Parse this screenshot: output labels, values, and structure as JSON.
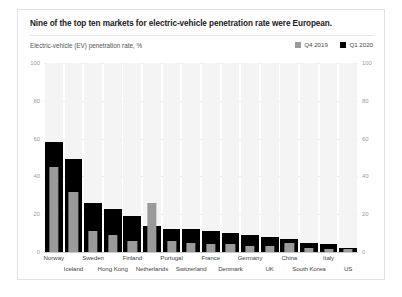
{
  "header": {
    "title": "Nine of the top ten markets for electric-vehicle penetration rate were European.",
    "subtitle": "Electric-vehicle (EV) penetration rate, %"
  },
  "legend": {
    "items": [
      {
        "label": "Q4 2019",
        "color": "#9a9a9a",
        "swatch_name": "legend-swatch-q4-2019"
      },
      {
        "label": "Q1 2020",
        "color": "#000000",
        "swatch_name": "legend-swatch-q1-2020"
      }
    ]
  },
  "colors": {
    "q4_2019": "#9a9a9a",
    "q1_2020": "#000000",
    "bar_track": "#f4f4f4",
    "gridline": "#ececec",
    "axis": "#c9c9c9",
    "card_border": "#e2e2e2",
    "title_text": "#1a1a1a",
    "subtitle_text": "#555555",
    "tick_text": "#9b9b9b",
    "xlabel_text": "#444444"
  },
  "chart_data": {
    "type": "bar",
    "title": "Nine of the top ten markets for electric-vehicle penetration rate were European.",
    "subtitle": "Electric-vehicle (EV) penetration rate, %",
    "xlabel": "",
    "ylabel": "Electric-vehicle (EV) penetration rate, %",
    "ylim": [
      0,
      100
    ],
    "yticks": [
      0,
      20,
      40,
      60,
      80,
      100
    ],
    "ytick_labels": [
      "0",
      "20",
      "40",
      "60",
      "80",
      "100"
    ],
    "grid": true,
    "legend_position": "top-right",
    "dual_y_axis": true,
    "categories": [
      "Norway",
      "Iceland",
      "Sweden",
      "Hong Kong",
      "Finland",
      "Netherlands",
      "Portugal",
      "Switzerland",
      "France",
      "Denmark",
      "Germany",
      "UK",
      "China",
      "South Korea",
      "Italy",
      "US"
    ],
    "series": [
      {
        "name": "Q4 2019",
        "color": "#9a9a9a",
        "values": [
          45,
          32,
          11,
          9,
          6,
          26,
          6,
          5,
          4,
          4,
          3,
          3,
          5,
          2,
          1.5,
          1.5
        ]
      },
      {
        "name": "Q1 2020",
        "color": "#000000",
        "values": [
          58,
          49,
          26,
          23,
          19,
          14,
          12,
          12,
          11,
          10,
          9,
          8,
          7,
          5,
          4,
          2
        ]
      }
    ]
  },
  "xaxis": {
    "rows": [
      {
        "row": 0,
        "labels": [
          "Norway",
          "Sweden",
          "Finland",
          "Portugal",
          "France",
          "Germany",
          "China",
          "Italy"
        ]
      },
      {
        "row": 1,
        "labels": [
          "Iceland",
          "Hong Kong",
          "Netherlands",
          "Switzerland",
          "Denmark",
          "UK",
          "South Korea",
          "US"
        ]
      }
    ]
  }
}
